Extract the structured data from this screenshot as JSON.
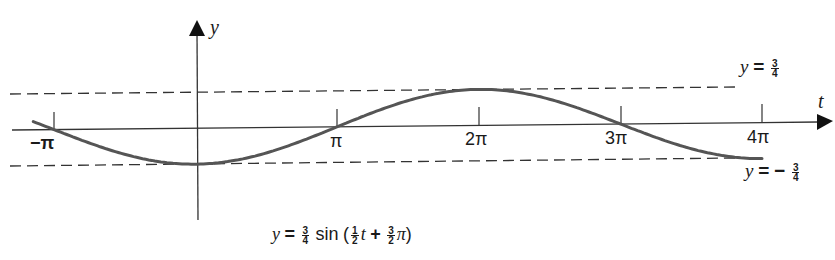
{
  "chart_data": {
    "type": "line",
    "title": "",
    "formula": {
      "lhs": "y",
      "eq": "=",
      "amp_num": "3",
      "amp_den": "4",
      "func": "sin",
      "open": "(",
      "freq_num": "1",
      "freq_den": "2",
      "var": "t",
      "plus": "+",
      "phase_num": "3",
      "phase_den": "2",
      "pi": "π",
      "close": ")"
    },
    "xlabel": "t",
    "ylabel": "y",
    "x_ticks": [
      "−π",
      "π",
      "2π",
      "3π",
      "4π"
    ],
    "x_tick_values": [
      -3.14159,
      3.14159,
      6.28319,
      9.42478,
      12.56637
    ],
    "xlim": [
      -3.6,
      12.6
    ],
    "ylim": [
      -0.75,
      0.75
    ],
    "reference_lines": [
      {
        "label_lhs": "y",
        "label_eq": "=",
        "label_sign": "",
        "label_num": "3",
        "label_den": "4",
        "value": 0.75,
        "style": "dashed"
      },
      {
        "label_lhs": "y",
        "label_eq": "=",
        "label_sign": "−",
        "label_num": "3",
        "label_den": "4",
        "value": -0.75,
        "style": "dashed"
      }
    ],
    "series": [
      {
        "name": "y = 3/4 sin(1/2 t + 3/2 π)",
        "x": [
          -3.6,
          -3.14159,
          -1.5708,
          0,
          1.5708,
          3.14159,
          4.7124,
          6.28319,
          7.854,
          9.42478,
          11.0,
          12.56637
        ],
        "values": [
          0.17,
          0.0,
          -0.53,
          -0.75,
          -0.53,
          0.0,
          0.53,
          0.75,
          0.53,
          0.0,
          -0.53,
          -0.75
        ]
      }
    ],
    "grid": false,
    "legend": "none"
  }
}
